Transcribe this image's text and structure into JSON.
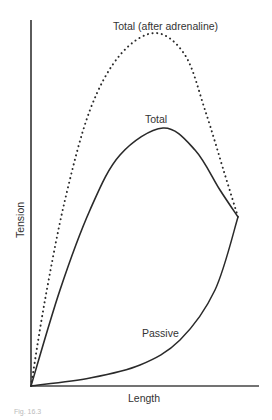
{
  "chart_data": {
    "type": "line",
    "title": "",
    "xlabel": "Length",
    "ylabel": "Tension",
    "grid": false,
    "legend": "none (curves labeled directly)",
    "axis_ticks": "none",
    "series": [
      {
        "name": "Total (after adrenaline)",
        "style": "dotted",
        "points_px": [
          [
            31,
            386
          ],
          [
            45,
            300
          ],
          [
            65,
            200
          ],
          [
            90,
            110
          ],
          [
            120,
            55
          ],
          [
            155,
            33
          ],
          [
            185,
            55
          ],
          [
            205,
            110
          ],
          [
            225,
            175
          ],
          [
            238,
            217
          ]
        ]
      },
      {
        "name": "Total",
        "style": "solid",
        "points_px": [
          [
            31,
            386
          ],
          [
            60,
            290
          ],
          [
            90,
            210
          ],
          [
            120,
            155
          ],
          [
            163,
            128
          ],
          [
            195,
            150
          ],
          [
            220,
            190
          ],
          [
            238,
            217
          ]
        ]
      },
      {
        "name": "Passive",
        "style": "solid",
        "points_px": [
          [
            31,
            386
          ],
          [
            90,
            378
          ],
          [
            140,
            365
          ],
          [
            180,
            340
          ],
          [
            215,
            290
          ],
          [
            238,
            217
          ]
        ]
      }
    ],
    "annotations": [
      {
        "text": "Total (after adrenaline)",
        "near": "peak of dotted curve"
      },
      {
        "text": "Total",
        "near": "peak of solid total curve"
      },
      {
        "text": "Passive",
        "near": "passive curve lower right"
      }
    ],
    "axes_px": {
      "origin": [
        31,
        386
      ],
      "y_top": [
        31,
        20
      ],
      "x_end": [
        259,
        386
      ]
    }
  },
  "labels": {
    "ylabel": "Tension",
    "xlabel": "Length",
    "adrenaline": "Total (after adrenaline)",
    "total": "Total",
    "passive": "Passive",
    "caption": "Fig. 16.3"
  }
}
